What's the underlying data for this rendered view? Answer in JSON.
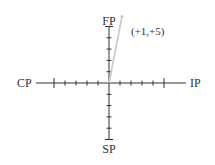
{
  "diagram": {
    "type": "four-quadrant axis diagram",
    "origin_px": [
      109,
      83
    ],
    "unit_px": {
      "x": 11,
      "y": 11.3
    },
    "ticks_per_direction": 5,
    "colors": {
      "axis": "#333333",
      "vector": "#c8c8c8",
      "text": "#333333",
      "background": "#ffffff"
    },
    "axes": {
      "left_label": "CP",
      "right_label": "IP",
      "top_label": "FP",
      "bottom_label": "SP"
    },
    "vector": {
      "from": [
        0,
        0
      ],
      "to": [
        1,
        5
      ],
      "label": "(+1,+5)"
    }
  }
}
